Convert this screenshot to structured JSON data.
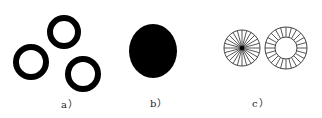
{
  "figure": {
    "panels": [
      {
        "id": "a",
        "label": "a）",
        "description": "three separate black rings",
        "shapes": [
          {
            "type": "ring",
            "cx": 64,
            "cy": 32,
            "r": 17,
            "stroke": 6
          },
          {
            "type": "ring",
            "cx": 31,
            "cy": 62,
            "r": 18,
            "stroke": 6
          },
          {
            "type": "ring",
            "cx": 83,
            "cy": 74,
            "r": 18,
            "stroke": 6
          }
        ]
      },
      {
        "id": "b",
        "label": "b）",
        "description": "solid black disc",
        "shapes": [
          {
            "type": "filled-ellipse",
            "cx": 153,
            "cy": 51,
            "rx": 24,
            "ry": 27
          }
        ]
      },
      {
        "id": "c",
        "label": "c）",
        "description": "radially segmented circle and segmented annulus",
        "shapes": [
          {
            "type": "spoked-disc",
            "cx": 242,
            "cy": 48,
            "r": 18,
            "spokes": 24
          },
          {
            "type": "segmented-annulus",
            "cx": 286,
            "cy": 48,
            "r_outer": 21,
            "r_inner": 11,
            "segments": 24
          }
        ]
      }
    ],
    "colors": {
      "ink": "#000000",
      "line": "#444444",
      "background": "#ffffff"
    }
  }
}
